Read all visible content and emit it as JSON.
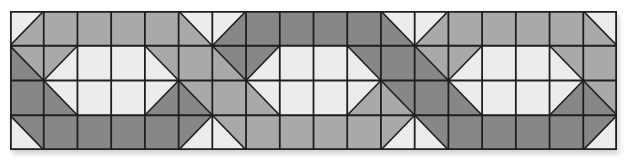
{
  "quilt": {
    "rows": 4,
    "cols": 18,
    "colors": {
      "W": "#ececec",
      "M": "#a9a9a9",
      "D": "#878787",
      "line": "#1e1e1e"
    },
    "blocks": [
      {
        "name": "block-1",
        "cells": [
          [
            {
              "d": "/",
              "a": "W",
              "b": "M"
            },
            "M",
            "M",
            "M",
            "M",
            {
              "d": "\\",
              "a": "W",
              "b": "M"
            }
          ],
          [
            {
              "d": "\\",
              "a": "M",
              "b": "D"
            },
            {
              "d": "/",
              "a": "M",
              "b": "W"
            },
            "W",
            "W",
            {
              "d": "\\",
              "a": "M",
              "b": "W"
            },
            "M"
          ],
          [
            "D",
            {
              "d": "\\",
              "a": "W",
              "b": "D"
            },
            "W",
            "W",
            {
              "d": "/",
              "a": "W",
              "b": "D"
            },
            {
              "d": "\\",
              "a": "M",
              "b": "D"
            }
          ],
          [
            {
              "d": "\\",
              "a": "D",
              "b": "W"
            },
            "D",
            "D",
            "D",
            "D",
            {
              "d": "/",
              "a": "D",
              "b": "W"
            }
          ]
        ]
      },
      {
        "name": "block-2",
        "cells": [
          [
            {
              "d": "/",
              "a": "W",
              "b": "D"
            },
            "D",
            "D",
            "D",
            "D",
            {
              "d": "\\",
              "a": "W",
              "b": "D"
            }
          ],
          [
            {
              "d": "\\",
              "a": "D",
              "b": "M"
            },
            {
              "d": "/",
              "a": "D",
              "b": "W"
            },
            "W",
            "W",
            {
              "d": "\\",
              "a": "D",
              "b": "W"
            },
            "D"
          ],
          [
            "M",
            {
              "d": "\\",
              "a": "W",
              "b": "M"
            },
            "W",
            "W",
            {
              "d": "/",
              "a": "W",
              "b": "M"
            },
            {
              "d": "\\",
              "a": "D",
              "b": "M"
            }
          ],
          [
            {
              "d": "\\",
              "a": "M",
              "b": "W"
            },
            "M",
            "M",
            "M",
            "M",
            {
              "d": "/",
              "a": "M",
              "b": "W"
            }
          ]
        ]
      },
      {
        "name": "block-3",
        "cells": [
          [
            {
              "d": "/",
              "a": "W",
              "b": "M"
            },
            "M",
            "M",
            "M",
            "M",
            {
              "d": "\\",
              "a": "W",
              "b": "M"
            }
          ],
          [
            {
              "d": "\\",
              "a": "M",
              "b": "D"
            },
            {
              "d": "/",
              "a": "M",
              "b": "W"
            },
            "W",
            "W",
            {
              "d": "\\",
              "a": "M",
              "b": "W"
            },
            "M"
          ],
          [
            "D",
            {
              "d": "\\",
              "a": "W",
              "b": "D"
            },
            "W",
            "W",
            {
              "d": "/",
              "a": "W",
              "b": "D"
            },
            {
              "d": "\\",
              "a": "M",
              "b": "D"
            }
          ],
          [
            {
              "d": "\\",
              "a": "D",
              "b": "W"
            },
            "D",
            "D",
            "D",
            "D",
            {
              "d": "/",
              "a": "D",
              "b": "W"
            }
          ]
        ]
      }
    ]
  }
}
